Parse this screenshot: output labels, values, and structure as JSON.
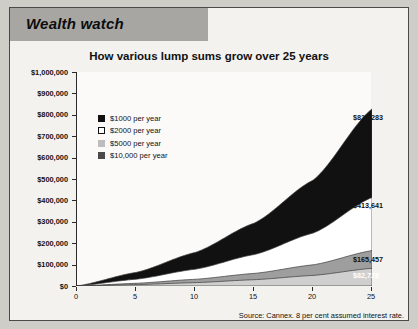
{
  "header": {
    "band_title": "Wealth watch"
  },
  "chart_title": "How various lump sums grow over 25 years",
  "source_note": "Source: Cannex. 8 per cent assumed interest rate.",
  "legend": {
    "items": [
      {
        "label": "$1000 per year",
        "swatch": "black"
      },
      {
        "label": "$2000 per year",
        "swatch": "white"
      },
      {
        "label": "$5000 per year",
        "swatch": "light-gray"
      },
      {
        "label": "$10,000 per year",
        "swatch": "dark-gray"
      }
    ]
  },
  "callouts": [
    {
      "value": "$827,283"
    },
    {
      "value": "$413,641"
    },
    {
      "value": "$165,457"
    },
    {
      "value": "$82,728"
    }
  ],
  "colors": {
    "band_black": "#111111",
    "band_white": "#ffffff",
    "band_mid_gray": "#9e9e9e",
    "band_light_gray": "#cdcdcd",
    "header_band": "#a8a6a2",
    "axis": "#2b2b2b",
    "paper": "#f3f2ef"
  },
  "chart_data": {
    "type": "area",
    "title": "How various lump sums grow over 25 years",
    "xlabel": "",
    "ylabel": "",
    "xlim": [
      0,
      25
    ],
    "ylim": [
      0,
      1000000
    ],
    "grid": false,
    "legend_position": "inside-top-left",
    "stacked": true,
    "x": [
      0,
      5,
      10,
      15,
      20,
      25
    ],
    "xticklabels": [
      "0",
      "5",
      "10",
      "15",
      "20",
      "25"
    ],
    "yticklabels": [
      "$0",
      "$100,000",
      "$200,000",
      "$300,000",
      "$400,000",
      "$500,000",
      "$600,000",
      "$700,000",
      "$800,000",
      "$900,000",
      "$1,000,000"
    ],
    "ytickvalues": [
      0,
      100000,
      200000,
      300000,
      400000,
      500000,
      600000,
      700000,
      800000,
      900000,
      1000000
    ],
    "note": "Cumulative value of annual contributions compounded at 8 per cent; bands are stacked so the top edge of each band is the plotted total.",
    "series": [
      {
        "name": "$1000 per year",
        "swatch": "black",
        "end_label": "$82,728",
        "values": [
          0,
          6336,
          15645,
          29324,
          49423,
          82728
        ]
      },
      {
        "name": "$2000 per year",
        "swatch": "white",
        "end_label": "$165,457",
        "values": [
          0,
          12672,
          31291,
          58649,
          98846,
          165457
        ]
      },
      {
        "name": "$5000 per year",
        "swatch": "light-gray",
        "end_label": "$413,641",
        "values": [
          0,
          31680,
          78227,
          146621,
          247115,
          413641
        ]
      },
      {
        "name": "$10,000 per year",
        "swatch": "dark-gray",
        "end_label": "$827,283",
        "values": [
          0,
          63359,
          156455,
          293243,
          494229,
          827283
        ]
      }
    ]
  }
}
